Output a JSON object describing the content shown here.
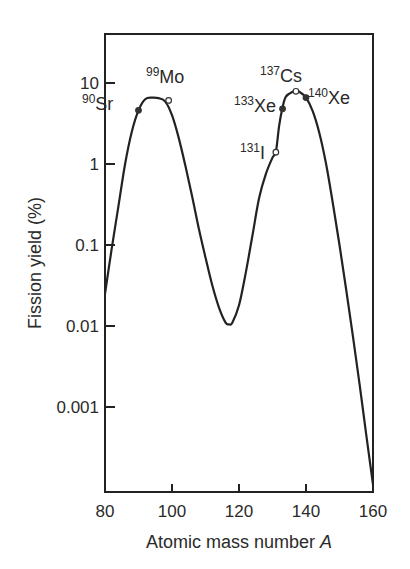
{
  "chart_data": {
    "type": "line",
    "title": "",
    "xlabel": "Atomic mass number",
    "xlabel_italic": "A",
    "ylabel": "Fission yield (%)",
    "yscale": "log",
    "xlim": [
      80,
      160
    ],
    "ylim": [
      0.0001,
      40
    ],
    "grid": false,
    "legend": null,
    "x_ticks": [
      80,
      100,
      120,
      140,
      160
    ],
    "x_tick_labels": [
      "80",
      "100",
      "120",
      "140",
      "160"
    ],
    "y_ticks": [
      10,
      1,
      0.1,
      0.01,
      0.001
    ],
    "y_tick_labels": [
      "10",
      "1",
      "0.1",
      "0.01",
      "0.001"
    ],
    "series": [
      {
        "name": "Fission yield curve",
        "color": "#222222",
        "x": [
          80,
          82,
          84,
          86,
          88,
          90,
          92,
          94,
          96,
          98,
          100,
          102,
          104,
          106,
          108,
          110,
          112,
          114,
          116,
          117,
          118,
          120,
          122,
          124,
          126,
          128,
          130,
          131,
          132,
          133,
          134,
          136,
          137,
          138,
          140,
          142,
          144,
          146,
          148,
          150,
          152,
          154,
          156,
          158,
          160
        ],
        "y": [
          0.025,
          0.09,
          0.3,
          1.0,
          2.5,
          4.6,
          6.3,
          6.6,
          6.5,
          5.9,
          4.0,
          2.1,
          0.95,
          0.4,
          0.16,
          0.07,
          0.032,
          0.017,
          0.011,
          0.0105,
          0.011,
          0.018,
          0.045,
          0.13,
          0.38,
          0.75,
          1.2,
          1.4,
          3.0,
          5.0,
          6.8,
          7.8,
          7.9,
          7.8,
          6.6,
          4.5,
          2.4,
          1.0,
          0.33,
          0.1,
          0.028,
          0.0075,
          0.0019,
          0.00045,
          0.00011
        ]
      }
    ],
    "points": [
      {
        "label": "Sr",
        "mass": "90",
        "x": 90,
        "y": 4.6,
        "marker": "filled"
      },
      {
        "label": "Mo",
        "mass": "99",
        "x": 99,
        "y": 6.1,
        "marker": "open"
      },
      {
        "label": "I",
        "mass": "131",
        "x": 131,
        "y": 1.4,
        "marker": "open"
      },
      {
        "label": "Xe",
        "mass": "133",
        "x": 133,
        "y": 4.8,
        "marker": "filled"
      },
      {
        "label": "Cs",
        "mass": "137",
        "x": 137,
        "y": 7.9,
        "marker": "open"
      },
      {
        "label": "Xe",
        "mass": "140",
        "x": 140,
        "y": 6.6,
        "marker": "filled"
      }
    ]
  }
}
